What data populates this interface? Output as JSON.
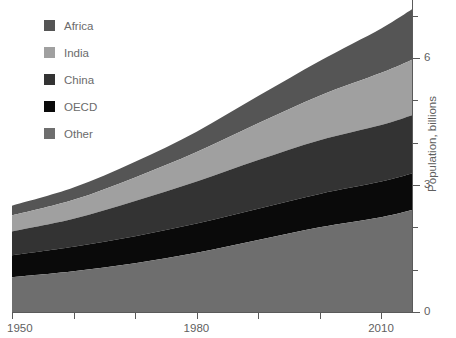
{
  "chart_data": {
    "type": "area",
    "stacked": true,
    "title": "",
    "subtitle": "",
    "xlabel": "",
    "ylabel": "Population, billions",
    "x": [
      1950,
      1960,
      1970,
      1980,
      1990,
      2000,
      2010,
      2015
    ],
    "xlim": [
      1950,
      2015
    ],
    "ylim": [
      0,
      7.4
    ],
    "xticks": [
      1950,
      1960,
      1970,
      1980,
      1990,
      2000,
      2010
    ],
    "xtick_labels": [
      "1950",
      "",
      "",
      "1980",
      "",
      "",
      "2010"
    ],
    "yticks": [
      0,
      1,
      2,
      3,
      4,
      5,
      6,
      7
    ],
    "ytick_labels": [
      "0",
      "",
      "",
      "3",
      "",
      "",
      "6",
      ""
    ],
    "y_axis_position": "right",
    "grid": false,
    "legend_position": "upper-left-inside",
    "stack_order_bottom_to_top": [
      "Other",
      "OECD",
      "China",
      "India",
      "Africa"
    ],
    "series": [
      {
        "name": "Africa",
        "color": "#555555",
        "values": [
          0.23,
          0.29,
          0.37,
          0.48,
          0.64,
          0.82,
          1.05,
          1.19
        ]
      },
      {
        "name": "India",
        "color": "#a0a0a0",
        "values": [
          0.38,
          0.45,
          0.56,
          0.7,
          0.87,
          1.05,
          1.23,
          1.31
        ]
      },
      {
        "name": "China",
        "color": "#333333",
        "values": [
          0.56,
          0.66,
          0.83,
          0.99,
          1.15,
          1.27,
          1.34,
          1.38
        ]
      },
      {
        "name": "OECD",
        "color": "#0a0a0a",
        "values": [
          0.52,
          0.58,
          0.64,
          0.69,
          0.74,
          0.79,
          0.84,
          0.86
        ]
      },
      {
        "name": "Other",
        "color": "#6e6e6e",
        "values": [
          0.82,
          0.96,
          1.15,
          1.4,
          1.7,
          2.0,
          2.24,
          2.41
        ]
      }
    ],
    "totals": [
      2.51,
      2.94,
      3.55,
      4.26,
      5.1,
      5.93,
      6.7,
      7.15
    ]
  },
  "legend": {
    "items": [
      {
        "label": "Africa",
        "color": "#555555"
      },
      {
        "label": "India",
        "color": "#a0a0a0"
      },
      {
        "label": "China",
        "color": "#333333"
      },
      {
        "label": "OECD",
        "color": "#0a0a0a"
      },
      {
        "label": "Other",
        "color": "#6e6e6e"
      }
    ]
  },
  "axes": {
    "y_title": "Population, billions",
    "x_tick_0": "1950",
    "x_tick_1980": "1980",
    "x_tick_2010": "2010",
    "y_tick_0": "0",
    "y_tick_3": "3",
    "y_tick_6": "6"
  },
  "colors": {
    "background": "#ffffff",
    "axis": "#5a5a5a",
    "text": "#5f5f5f",
    "legend_text": "#6b6b6b"
  }
}
